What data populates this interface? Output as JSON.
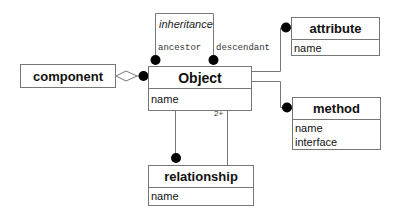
{
  "diagram": {
    "type": "object-model",
    "classes": {
      "component": {
        "name": "component",
        "attributes": []
      },
      "object": {
        "name": "Object",
        "attributes": [
          "name"
        ]
      },
      "attribute": {
        "name": "attribute",
        "attributes": [
          "name"
        ]
      },
      "method": {
        "name": "method",
        "attributes": [
          "name",
          "interface"
        ]
      },
      "relationship": {
        "name": "relationship",
        "attributes": [
          "name"
        ]
      }
    },
    "association_class": {
      "name": "inheritance"
    },
    "role_labels": {
      "ancestor": "ancestor",
      "descendant": "descendant"
    },
    "multiplicity": {
      "object_relationship": "2+"
    },
    "relations": [
      {
        "from": "component",
        "to": "Object",
        "kind": "aggregation",
        "end": "many"
      },
      {
        "from": "Object",
        "to": "Object",
        "kind": "association",
        "label": "inheritance",
        "roles": [
          "ancestor",
          "descendant"
        ],
        "ends": "many"
      },
      {
        "from": "Object",
        "to": "attribute",
        "kind": "association",
        "end": "many"
      },
      {
        "from": "Object",
        "to": "method",
        "kind": "association",
        "end": "many"
      },
      {
        "from": "Object",
        "to": "relationship",
        "kind": "association",
        "end": "many"
      },
      {
        "from": "relationship",
        "to": "Object",
        "kind": "association",
        "multiplicity": "2+"
      }
    ]
  }
}
